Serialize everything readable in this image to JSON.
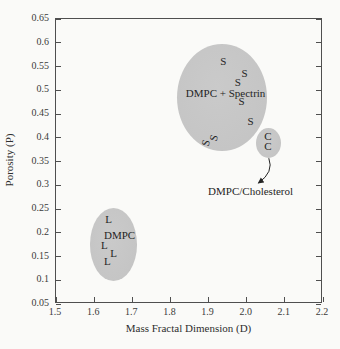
{
  "colors": {
    "background": "#fafaf8",
    "axis": "#4f4f4f",
    "ellipse_fill": "#c5c5c5",
    "text": "#252525"
  },
  "chart_data": {
    "type": "scatter",
    "title": "",
    "xlabel": "Mass Fractal Dimension (D)",
    "ylabel": "Porosity (P)",
    "xlim": [
      1.5,
      2.2
    ],
    "ylim": [
      0.05,
      0.65
    ],
    "x_tick_labels": [
      "1.5",
      "1.6",
      "1.7",
      "1.8",
      "1.9",
      "2.0",
      "2.1",
      "2.2"
    ],
    "x_tick_values": [
      1.5,
      1.6,
      1.7,
      1.8,
      1.9,
      2.0,
      2.1,
      2.2
    ],
    "y_tick_labels": [
      "0.05",
      "0.1",
      "0.15",
      "0.2",
      "0.25",
      "0.3",
      "0.35",
      "0.4",
      "0.45",
      "0.5",
      "0.55",
      "0.6",
      "0.65"
    ],
    "y_tick_values": [
      0.05,
      0.1,
      0.15,
      0.2,
      0.25,
      0.3,
      0.35,
      0.4,
      0.45,
      0.5,
      0.55,
      0.6,
      0.65
    ],
    "grid": false,
    "legend": "none",
    "clusters": [
      {
        "name": "dmpc-spectrin",
        "label": "DMPC + Spectrin",
        "label_pos": {
          "x": 1.948,
          "y": 0.494
        },
        "ellipse": {
          "cx": 1.938,
          "cy": 0.484,
          "rx": 0.119,
          "ry": 0.114
        },
        "marker": "S",
        "points": [
          {
            "x": 1.942,
            "y": 0.56,
            "rotate": 0
          },
          {
            "x": 1.998,
            "y": 0.536,
            "rotate": 0
          },
          {
            "x": 1.98,
            "y": 0.517,
            "rotate": 0
          },
          {
            "x": 1.99,
            "y": 0.477,
            "rotate": 0
          },
          {
            "x": 2.014,
            "y": 0.433,
            "rotate": 0
          },
          {
            "x": 1.917,
            "y": 0.398,
            "rotate": -75
          },
          {
            "x": 1.896,
            "y": 0.387,
            "rotate": -75
          }
        ]
      },
      {
        "name": "dmpc",
        "label": "DMPC",
        "label_pos": {
          "x": 1.668,
          "y": 0.191
        },
        "ellipse": {
          "cx": 1.652,
          "cy": 0.172,
          "rx": 0.063,
          "ry": 0.078
        },
        "marker": "L",
        "points": [
          {
            "x": 1.639,
            "y": 0.225,
            "rotate": 0
          },
          {
            "x": 1.628,
            "y": 0.17,
            "rotate": 0
          },
          {
            "x": 1.652,
            "y": 0.153,
            "rotate": 0
          },
          {
            "x": 1.636,
            "y": 0.136,
            "rotate": 0
          }
        ]
      },
      {
        "name": "dmpc-cholesterol",
        "label": "",
        "label_pos": null,
        "ellipse": {
          "cx": 2.062,
          "cy": 0.387,
          "rx": 0.033,
          "ry": 0.032
        },
        "marker": "C",
        "points": [
          {
            "x": 2.06,
            "y": 0.402,
            "rotate": 0
          },
          {
            "x": 2.06,
            "y": 0.381,
            "rotate": 0
          }
        ]
      }
    ],
    "annotation": {
      "text": "DMPC/Cholesterol",
      "text_pos": {
        "x": 2.014,
        "y": 0.286
      },
      "arrow": {
        "from": {
          "x": 2.058,
          "y": 0.357
        },
        "ctrl": {
          "x": 2.072,
          "y": 0.328
        },
        "to": {
          "x": 2.031,
          "y": 0.305
        }
      }
    }
  }
}
